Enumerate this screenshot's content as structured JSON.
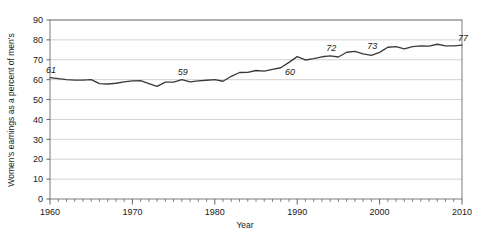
{
  "chart_data": {
    "type": "line",
    "title": "",
    "xlabel": "Year",
    "ylabel": "Women's earnings as a percent of men's",
    "xlim": [
      1960,
      2010
    ],
    "ylim": [
      0,
      90
    ],
    "grid": true,
    "legend": "none",
    "y_ticks": [
      "0",
      "10",
      "20",
      "30",
      "40",
      "50",
      "60",
      "70",
      "80",
      "90"
    ],
    "y_tick_values": [
      0,
      10,
      20,
      30,
      40,
      50,
      60,
      70,
      80,
      90
    ],
    "x_ticks": [
      "1960",
      "1970",
      "1980",
      "1990",
      "2000",
      "2010"
    ],
    "x_tick_values": [
      1960,
      1970,
      1980,
      1990,
      2000,
      2010
    ],
    "x_minor_tick_step": 1,
    "series_name": "Women's earnings as a percent of men's",
    "line_color": "#3a3a3a",
    "grid_color": "#c8c8c8",
    "axis_color": "#555555",
    "x": [
      1960,
      1961,
      1962,
      1963,
      1964,
      1965,
      1966,
      1967,
      1968,
      1969,
      1970,
      1971,
      1972,
      1973,
      1974,
      1975,
      1976,
      1977,
      1978,
      1979,
      1980,
      1981,
      1982,
      1983,
      1984,
      1985,
      1986,
      1987,
      1988,
      1989,
      1990,
      1991,
      1992,
      1993,
      1994,
      1995,
      1996,
      1997,
      1998,
      1999,
      2000,
      2001,
      2002,
      2003,
      2004,
      2005,
      2006,
      2007,
      2008,
      2009,
      2010
    ],
    "values": [
      61,
      60.5,
      60,
      59.8,
      59.8,
      60,
      58,
      57.8,
      58.2,
      58.9,
      59.4,
      59.5,
      58,
      56.6,
      58.8,
      58.8,
      60,
      58.9,
      59.4,
      59.7,
      60,
      59.2,
      61.7,
      63.6,
      63.7,
      64.6,
      64.3,
      65.2,
      66,
      68.7,
      71.6,
      69.9,
      70.6,
      71.5,
      72,
      71.4,
      73.8,
      74.2,
      73,
      72.2,
      73.7,
      76.3,
      76.6,
      75.5,
      76.6,
      77,
      76.9,
      77.8,
      77,
      77,
      77.4
    ],
    "data_labels": [
      {
        "label": "61",
        "year": 1960,
        "value": 61
      },
      {
        "label": "59",
        "year": 1976,
        "value": 60
      },
      {
        "label": "60",
        "year": 1989,
        "value": 60
      },
      {
        "label": "72",
        "year": 1994,
        "value": 72
      },
      {
        "label": "73",
        "year": 1999,
        "value": 73
      },
      {
        "label": "77",
        "year": 2010,
        "value": 77
      }
    ]
  }
}
